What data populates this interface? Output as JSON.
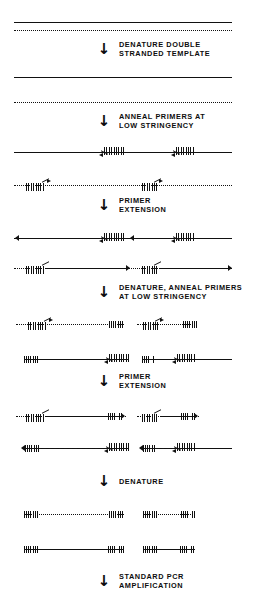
{
  "diagram": {
    "background_color": "#ffffff",
    "ink_color": "#111111",
    "arrow_glyph": "↓",
    "steps": [
      {
        "id": "denature-double-stranded-template",
        "line1": "DENATURE DOUBLE",
        "line2": "STRANDED TEMPLATE"
      },
      {
        "id": "anneal-primers-low-stringency",
        "line1": "ANNEAL PRIMERS AT",
        "line2": "LOW STRINGENCY"
      },
      {
        "id": "primer-extension-1",
        "line1": "PRIMER",
        "line2": "EXTENSION"
      },
      {
        "id": "denature-anneal-primers-low-stringency",
        "line1": "DENATURE, ANNEAL PRIMERS",
        "line2": "AT LOW STRINGENCY"
      },
      {
        "id": "primer-extension-2",
        "line1": "PRIMER",
        "line2": "EXTENSION"
      },
      {
        "id": "denature",
        "line1": "DENATURE",
        "line2": ""
      },
      {
        "id": "standard-pcr-amplification",
        "line1": "STANDARD PCR",
        "line2": "AMPLIFICATION"
      }
    ],
    "legend": {
      "solid_line": "template strand",
      "dotted_line": "complementary strand",
      "hatched_block": "degenerate primer / primer-derived end",
      "arrowhead": "direction of synthesis"
    }
  }
}
